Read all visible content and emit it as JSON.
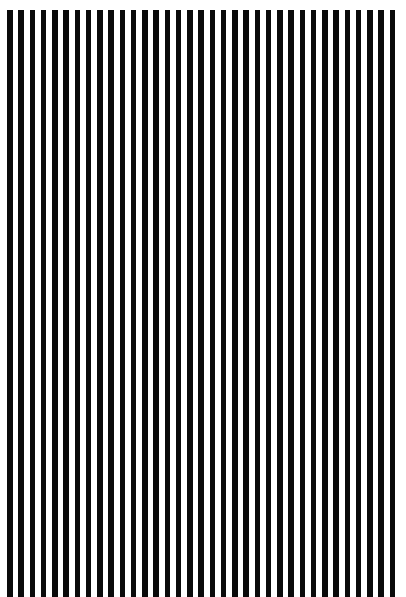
{
  "pattern": {
    "type": "vertical-stripes",
    "stripe_count": 35,
    "stripe_color": "#0a0a0a",
    "background_color": "#ffffff",
    "period_px": 11.25,
    "stripe_width_px": 5.5
  }
}
